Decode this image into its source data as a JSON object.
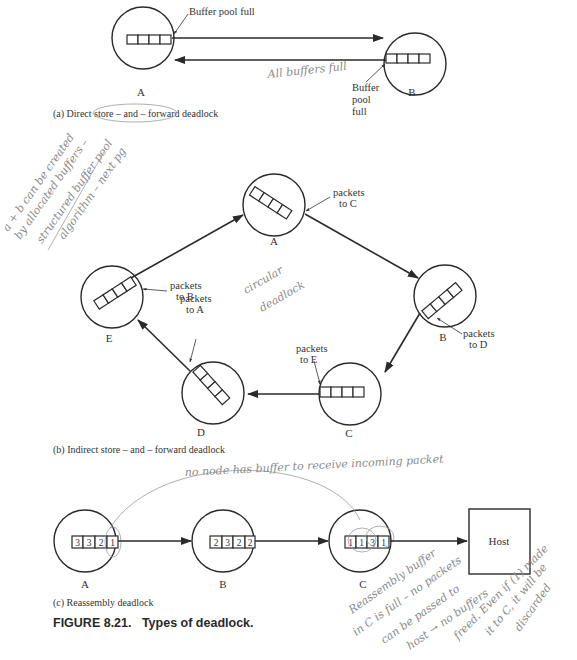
{
  "figure": {
    "title": "FIGURE 8.21.   Types of deadlock."
  },
  "panel_a": {
    "caption": "(a) Direct store – and – forward deadlock",
    "nodes": [
      {
        "id": "A",
        "label": "A"
      },
      {
        "id": "B",
        "label": "B"
      }
    ],
    "annotation_top": "Buffer pool full",
    "annotation_bottom": [
      "Buffer",
      "pool",
      "full"
    ],
    "handwritten": "All buffers full"
  },
  "panel_b": {
    "caption": "(b) Indirect store – and – forward deadlock",
    "nodes": [
      {
        "id": "A",
        "label": "A",
        "annotation": [
          "packets",
          "to C"
        ]
      },
      {
        "id": "B",
        "label": "B",
        "annotation": [
          "packets",
          "to D"
        ]
      },
      {
        "id": "C",
        "label": "C",
        "annotation": [
          "packets",
          "to E"
        ]
      },
      {
        "id": "D",
        "label": "D",
        "annotation": [
          "packets",
          "to A"
        ]
      },
      {
        "id": "E",
        "label": "E",
        "annotation": [
          "packets",
          "to B"
        ]
      }
    ],
    "handwritten_center": [
      "circular",
      "deadlock"
    ],
    "handwritten_margin": [
      "a + b can be created",
      "by allocated buffers –",
      "structured buffer pool",
      "algorithm – next pg"
    ]
  },
  "panel_c": {
    "caption": "(c) Reassembly deadlock",
    "nodes": [
      {
        "id": "A",
        "label": "A",
        "buffers": [
          "3",
          "3",
          "2",
          "1"
        ]
      },
      {
        "id": "B",
        "label": "B",
        "buffers": [
          "2",
          "3",
          "2",
          "2"
        ]
      },
      {
        "id": "C",
        "label": "C",
        "buffers": [
          "1",
          "1",
          "3",
          "1"
        ]
      }
    ],
    "host_label": "Host",
    "handwritten_top": "no node has buffer to receive incoming packet",
    "handwritten_bottom": [
      "Reassembly buffer",
      "in C is full – no packets",
      "can be passed to",
      "host → no buffers",
      "freed. Even if (1) made",
      "it to C, it will be",
      "discarded"
    ]
  }
}
